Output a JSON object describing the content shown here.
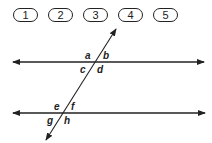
{
  "answer_choices": [
    {
      "label": "1"
    },
    {
      "label": "2"
    },
    {
      "label": "3"
    },
    {
      "label": "4"
    },
    {
      "label": "5"
    }
  ],
  "diagram": {
    "angle_labels": {
      "top_intersection": {
        "a": "a",
        "b": "b",
        "c": "c",
        "d": "d"
      },
      "bottom_intersection": {
        "e": "e",
        "f": "f",
        "g": "g",
        "h": "h"
      }
    },
    "line_color": "#222222"
  }
}
